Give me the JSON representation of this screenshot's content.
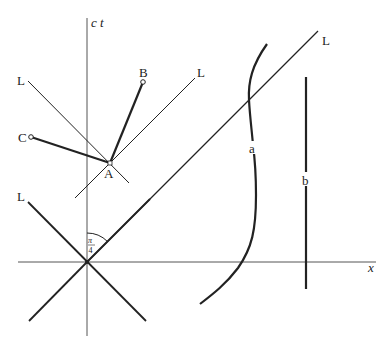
{
  "diagram": {
    "type": "spacetime-diagram",
    "axes": {
      "vertical_label": "c t",
      "horizontal_label": "x"
    },
    "light_cone_labels": [
      "L",
      "L",
      "L",
      "L"
    ],
    "events": {
      "A": "A",
      "B": "B",
      "C": "C"
    },
    "worldlines": {
      "a": "a",
      "b": "b"
    },
    "angle": {
      "numerator": "π",
      "denominator": "4"
    },
    "colors": {
      "ink": "#222222",
      "axis": "#555555",
      "background": "#ffffff"
    }
  }
}
